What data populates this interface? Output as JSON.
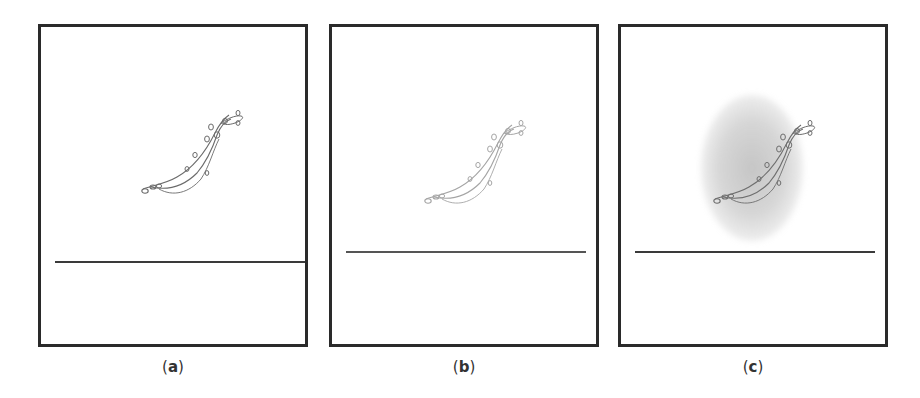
{
  "figure": {
    "panels": [
      {
        "id": "a",
        "label_open": "(",
        "label_letter": "a",
        "label_close": ")",
        "variant": "original sketch"
      },
      {
        "id": "b",
        "label_open": "(",
        "label_letter": "b",
        "label_close": ")",
        "variant": "lighter sketch"
      },
      {
        "id": "c",
        "label_open": "(",
        "label_letter": "c",
        "label_close": ")",
        "variant": "sketch with gray haze"
      }
    ],
    "colors": {
      "border": "#2a2a2a",
      "stroke_a": "#6b6b6b",
      "stroke_b": "#8c8c8c",
      "stroke_c": "#6e6e6e",
      "haze": "#a8a8a8",
      "background": "#ffffff"
    }
  }
}
